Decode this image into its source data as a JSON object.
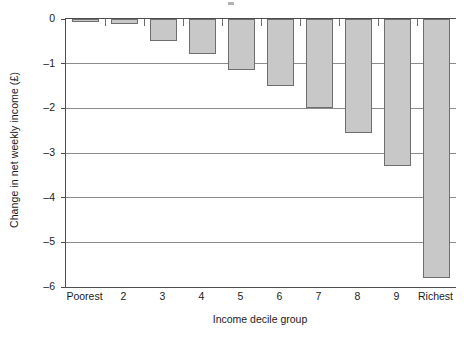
{
  "chart_data": {
    "type": "bar",
    "title": "",
    "xlabel": "Income decile group",
    "ylabel": "Change in net weekly income (£)",
    "categories": [
      "Poorest",
      "2",
      "3",
      "4",
      "5",
      "6",
      "7",
      "8",
      "9",
      "Richest"
    ],
    "values": [
      -0.02,
      -0.12,
      -0.5,
      -0.78,
      -1.15,
      -1.5,
      -2.0,
      -2.55,
      -3.3,
      -5.8
    ],
    "ylim": [
      -6,
      0
    ],
    "yticks": [
      0,
      -1,
      -2,
      -3,
      -4,
      -5,
      -6
    ],
    "ytick_labels": [
      "0",
      "–1",
      "–2",
      "–3",
      "–4",
      "–5",
      "–6"
    ],
    "grid": "horizontal",
    "legend": "none",
    "bar_fill_color": "#c8c8c8",
    "bar_border_color": "#6e6e6e",
    "gridline_color": "#8c8c8c",
    "axis_color": "#4d4d4d"
  }
}
